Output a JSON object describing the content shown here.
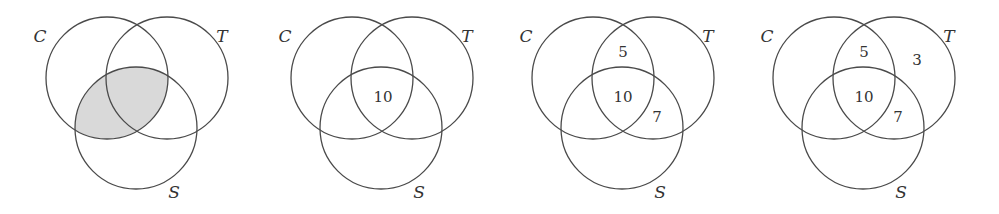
{
  "figure": {
    "colors": {
      "stroke": "#4a4a4a",
      "shade": "#d9d9d9",
      "text": "#333333",
      "background": "#ffffff"
    },
    "set_labels": {
      "c": "C",
      "t": "T",
      "s": "S"
    },
    "panels": [
      {
        "id": "panel-1",
        "offset_x": 0,
        "shaded_region": "C ∩ S",
        "counts": []
      },
      {
        "id": "panel-2",
        "offset_x": 245,
        "shaded_region": "",
        "counts": [
          {
            "region": "C∩T∩S",
            "value": "10",
            "x": 138,
            "y": 102
          }
        ]
      },
      {
        "id": "panel-3",
        "offset_x": 486,
        "shaded_region": "",
        "counts": [
          {
            "region": "C∩T only",
            "value": "5",
            "x": 137,
            "y": 57
          },
          {
            "region": "C∩T∩S",
            "value": "10",
            "x": 137,
            "y": 102
          },
          {
            "region": "T∩S only",
            "value": "7",
            "x": 171,
            "y": 122
          }
        ]
      },
      {
        "id": "panel-4",
        "offset_x": 727,
        "shaded_region": "",
        "counts": [
          {
            "region": "C∩T only",
            "value": "5",
            "x": 137,
            "y": 57
          },
          {
            "region": "T only",
            "value": "3",
            "x": 190,
            "y": 65
          },
          {
            "region": "C∩T∩S",
            "value": "10",
            "x": 137,
            "y": 102
          },
          {
            "region": "T∩S only",
            "value": "7",
            "x": 171,
            "y": 122
          }
        ]
      }
    ]
  }
}
